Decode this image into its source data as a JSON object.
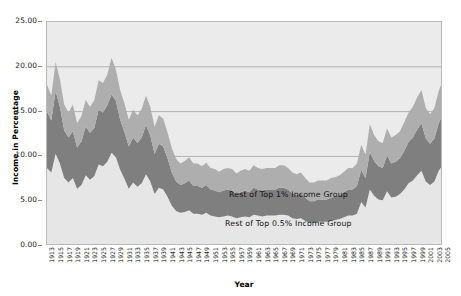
{
  "chart_data": {
    "type": "area",
    "stacked": true,
    "title": "",
    "xlabel": "Year",
    "ylabel": "Income in Percentage",
    "ylim": [
      0,
      25
    ],
    "yticks": [
      "0.00",
      "5.00",
      "10.00",
      "15.00",
      "20.00",
      "25.00"
    ],
    "ytick_values": [
      0,
      5,
      10,
      15,
      20,
      25
    ],
    "grid": "horizontal",
    "legend_position": "in-plot-annotations",
    "plot_background": "#ebebeb",
    "x": [
      1913,
      1914,
      1915,
      1916,
      1917,
      1918,
      1919,
      1920,
      1921,
      1922,
      1923,
      1924,
      1925,
      1926,
      1927,
      1928,
      1929,
      1930,
      1931,
      1932,
      1933,
      1934,
      1935,
      1936,
      1937,
      1938,
      1939,
      1940,
      1941,
      1942,
      1943,
      1944,
      1945,
      1946,
      1947,
      1948,
      1949,
      1950,
      1951,
      1952,
      1953,
      1954,
      1955,
      1956,
      1957,
      1958,
      1959,
      1960,
      1961,
      1962,
      1963,
      1964,
      1965,
      1966,
      1967,
      1968,
      1969,
      1970,
      1971,
      1972,
      1973,
      1974,
      1975,
      1976,
      1977,
      1978,
      1979,
      1980,
      1981,
      1982,
      1983,
      1984,
      1985,
      1986,
      1987,
      1988,
      1989,
      1990,
      1991,
      1992,
      1993,
      1994,
      1995,
      1996,
      1997,
      1998,
      1999,
      2000,
      2001,
      2002,
      2003,
      2004,
      2005
    ],
    "xtick_labels": [
      1913,
      1915,
      1917,
      1919,
      1921,
      1923,
      1925,
      1927,
      1929,
      1931,
      1933,
      1935,
      1937,
      1939,
      1941,
      1943,
      1945,
      1947,
      1949,
      1951,
      1953,
      1955,
      1957,
      1959,
      1961,
      1963,
      1965,
      1967,
      1969,
      1971,
      1973,
      1975,
      1977,
      1979,
      1981,
      1983,
      1985,
      1987,
      1989,
      1991,
      1993,
      1995,
      1997,
      1999,
      2001,
      2003,
      2005
    ],
    "series": [
      {
        "name": "Top 0.1% Income Group",
        "color": "#e6e6e6",
        "stack_order": 1,
        "values": [
          8.7,
          8.2,
          10.3,
          9.2,
          7.6,
          7.1,
          7.6,
          6.4,
          6.8,
          7.9,
          7.4,
          7.8,
          9.1,
          8.9,
          9.4,
          10.4,
          9.9,
          8.5,
          7.5,
          6.4,
          7.1,
          6.6,
          7.0,
          8.0,
          7.2,
          5.8,
          6.5,
          6.3,
          5.5,
          4.5,
          3.9,
          3.7,
          3.8,
          4.0,
          3.6,
          3.6,
          3.5,
          3.7,
          3.4,
          3.3,
          3.2,
          3.3,
          3.4,
          3.3,
          3.1,
          3.2,
          3.3,
          3.2,
          3.5,
          3.4,
          3.3,
          3.4,
          3.4,
          3.4,
          3.5,
          3.5,
          3.4,
          3.1,
          3.0,
          3.1,
          2.8,
          2.6,
          2.6,
          2.7,
          2.7,
          2.7,
          2.8,
          2.9,
          3.0,
          3.2,
          3.4,
          3.4,
          3.6,
          4.9,
          4.3,
          6.3,
          5.6,
          5.2,
          5.1,
          6.1,
          5.4,
          5.5,
          5.8,
          6.3,
          7.0,
          7.3,
          7.9,
          8.4,
          7.2,
          6.8,
          7.2,
          8.4,
          9.1
        ]
      },
      {
        "name": "Rest of Top 0.5% Income Group",
        "color": "#7f7f7f",
        "stack_order": 2,
        "values": [
          6.3,
          5.8,
          7.0,
          6.3,
          5.3,
          5.0,
          5.2,
          4.6,
          4.9,
          5.4,
          5.2,
          5.4,
          6.1,
          6.0,
          6.3,
          6.5,
          6.3,
          5.6,
          5.2,
          4.7,
          5.0,
          4.9,
          5.1,
          5.5,
          5.1,
          4.5,
          4.9,
          4.8,
          4.3,
          3.7,
          3.3,
          3.1,
          3.2,
          3.3,
          3.1,
          3.1,
          3.0,
          3.1,
          2.9,
          2.9,
          2.8,
          2.9,
          2.9,
          2.9,
          2.7,
          2.8,
          2.9,
          2.8,
          3.0,
          2.9,
          2.9,
          2.9,
          2.9,
          2.9,
          3.0,
          3.0,
          2.9,
          2.8,
          2.7,
          2.8,
          2.6,
          2.4,
          2.4,
          2.5,
          2.5,
          2.5,
          2.6,
          2.6,
          2.7,
          2.8,
          2.9,
          2.9,
          3.1,
          3.6,
          3.3,
          4.2,
          3.9,
          3.7,
          3.6,
          4.0,
          3.8,
          3.9,
          4.0,
          4.3,
          4.6,
          4.8,
          5.1,
          5.3,
          4.8,
          4.6,
          4.8,
          5.3,
          5.6
        ]
      },
      {
        "name": "Rest of Top 1% Income Group",
        "color": "#aeaeae",
        "stack_order": 3,
        "values": [
          3.0,
          2.8,
          3.2,
          3.1,
          2.9,
          2.8,
          3.0,
          2.7,
          2.8,
          3.0,
          2.9,
          3.1,
          3.3,
          3.3,
          3.4,
          4.1,
          3.5,
          3.3,
          3.2,
          3.0,
          3.1,
          3.1,
          3.2,
          3.3,
          3.2,
          3.0,
          3.2,
          3.1,
          2.9,
          2.7,
          2.5,
          2.4,
          2.5,
          2.6,
          2.5,
          2.5,
          2.4,
          2.5,
          2.4,
          2.4,
          2.3,
          2.4,
          2.4,
          2.4,
          2.3,
          2.4,
          2.4,
          2.4,
          2.5,
          2.4,
          2.4,
          2.4,
          2.4,
          2.4,
          2.5,
          2.5,
          2.4,
          2.3,
          2.3,
          2.3,
          2.2,
          2.1,
          2.1,
          2.1,
          2.1,
          2.1,
          2.2,
          2.2,
          2.2,
          2.3,
          2.4,
          2.4,
          2.5,
          2.8,
          2.6,
          3.1,
          2.9,
          2.8,
          2.8,
          3.0,
          2.9,
          3.0,
          3.0,
          3.2,
          3.3,
          3.4,
          3.6,
          3.7,
          3.4,
          3.3,
          3.4,
          3.6,
          3.8
        ]
      }
    ],
    "annotations": [
      {
        "text": "Rest of Top 1% Income Group",
        "name": "annotation-rest-top-1pct"
      },
      {
        "text": "Rest of Top 0.5% Income Group",
        "name": "annotation-rest-top-05pct"
      },
      {
        "text": "Top 0.1% Income Group",
        "name": "annotation-top-01pct"
      }
    ]
  },
  "axes": {
    "y_title": "Income in Percentage",
    "x_title": "Year"
  }
}
